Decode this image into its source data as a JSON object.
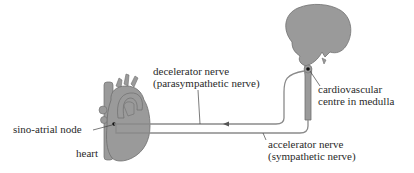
{
  "diagram": {
    "colors": {
      "organ_fill": "#9a9a9a",
      "organ_stroke": "#6e6e6e",
      "nerve_stroke": "#8a8a8a",
      "text": "#2a2a2a",
      "background": "#ffffff"
    },
    "labels": {
      "decelerator_line1": "decelerator nerve",
      "decelerator_line2": "(parasympathetic nerve)",
      "cardiovascular_line1": "cardiovascular",
      "cardiovascular_line2": "centre in medulla",
      "sino_atrial": "sino-atrial node",
      "heart": "heart",
      "accelerator_line1": "accelerator nerve",
      "accelerator_line2": "(sympathetic nerve)"
    },
    "structures": [
      "brain",
      "medulla / spinal cord",
      "heart",
      "sino-atrial node",
      "decelerator nerve",
      "accelerator nerve"
    ],
    "arrow_direction": "decelerator nerve impulse travels from medulla toward heart"
  }
}
